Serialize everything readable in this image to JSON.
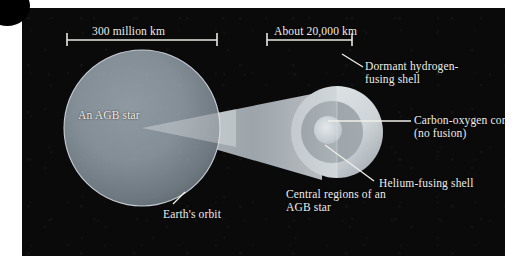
{
  "figure": {
    "background_color": "#ffffff",
    "panel_color": "#0a0a0b",
    "label_color": "#efeee8",
    "star_color": "#7f8a93",
    "orbit_ring_color": "#c9cfd4",
    "wedge_color": "#b9c0c4",
    "shell_outer_color": "#d6dadd",
    "shell_middle_color": "#a9b0b5",
    "core_color": "#cfd4d7"
  },
  "scale_bars": {
    "left": {
      "label": "300 million km",
      "value": 300,
      "unit": "million km",
      "approximate": false
    },
    "right": {
      "label": "About 20,000 km",
      "value": 20000,
      "unit": "km",
      "approximate": true
    }
  },
  "main_star": {
    "label": "An AGB star",
    "orbit_label": "Earth's orbit"
  },
  "inset": {
    "caption": "Central regions of an AGB star",
    "layers": [
      {
        "name": "dormant-hydrogen-fusing-shell",
        "label": "Dormant hydrogen-fusing shell"
      },
      {
        "name": "helium-fusing-shell",
        "label": "Helium-fusing shell"
      },
      {
        "name": "carbon-oxygen-core",
        "label": "Carbon-oxygen core (no fusion)"
      }
    ]
  },
  "labels": {
    "agb_star": "An AGB star",
    "earths_orbit": "Earth's orbit",
    "scale_left": "300 million km",
    "scale_right": "About 20,000 km",
    "dormant_shell": "Dormant hydrogen-fusing shell",
    "carbon_core": "Carbon-oxygen core (no fusion)",
    "helium_shell": "Helium-fusing shell",
    "central_regions": "Central regions of an AGB star"
  }
}
